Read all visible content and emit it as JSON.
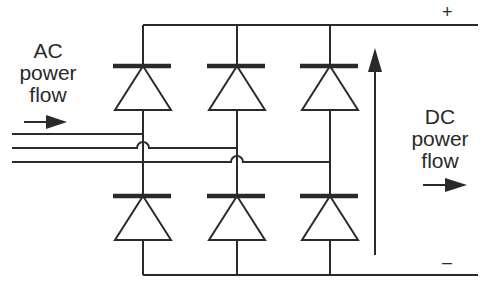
{
  "diagram": {
    "type": "three-phase bridge rectifier",
    "ac_label": {
      "line1": "AC",
      "line2": "power",
      "line3": "flow"
    },
    "dc_label": {
      "line1": "DC",
      "line2": "power",
      "line3": "flow"
    },
    "positive_terminal": "+",
    "negative_terminal": "–",
    "upper_diodes": 3,
    "lower_diodes": 3,
    "ac_phases": 3,
    "line_color": "#2a2a2a"
  }
}
